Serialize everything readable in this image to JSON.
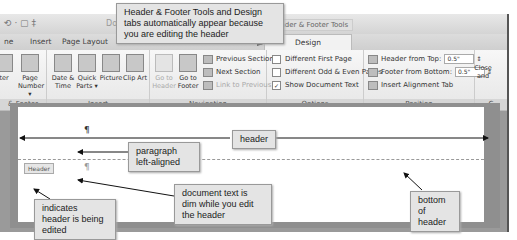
{
  "window": {
    "doc_title_fragment": "Do",
    "contextual_tab_label": "Header & Footer Tools",
    "quick_access": "⟲ · ▢ ‡"
  },
  "tabs": [
    {
      "label": "ne",
      "active": false
    },
    {
      "label": "Insert",
      "active": false
    },
    {
      "label": "Page Layout",
      "active": false
    },
    {
      "label": "R",
      "active": false
    },
    {
      "label": "View",
      "active": false
    },
    {
      "label": "Design",
      "active": true
    }
  ],
  "ribbon": {
    "header_footer_group": {
      "label": "& Footer",
      "buttons": [
        {
          "label": "ter"
        },
        {
          "label": "Page Number ▾"
        }
      ]
    },
    "insert_group": {
      "label": "Insert",
      "buttons": [
        {
          "label": "Date & Time"
        },
        {
          "label": "Quick Parts ▾"
        },
        {
          "label": "Picture"
        },
        {
          "label": "Clip Art"
        }
      ]
    },
    "navigation_group": {
      "label": "Navigation",
      "buttons": [
        {
          "label": "Go to Header",
          "enabled": false
        },
        {
          "label": "Go to Footer",
          "enabled": true
        }
      ],
      "small": [
        {
          "label": "Previous Section",
          "enabled": true
        },
        {
          "label": "Next Section",
          "enabled": true
        },
        {
          "label": "Link to Previous",
          "enabled": false
        }
      ]
    },
    "options_group": {
      "label": "Options",
      "checkboxes": [
        {
          "label": "Different First Page",
          "checked": false
        },
        {
          "label": "Different Odd & Even Pages",
          "checked": false
        },
        {
          "label": "Show Document Text",
          "checked": true
        }
      ]
    },
    "position_group": {
      "label": "Position",
      "header_from_top_label": "Header from Top:",
      "header_from_top_value": "0.5\"",
      "footer_from_bottom_label": "Footer from Bottom:",
      "footer_from_bottom_value": "0.5\"",
      "insert_alignment_tab": "Insert Alignment Tab"
    },
    "close_group": {
      "label": "C",
      "button": "Close and"
    }
  },
  "document": {
    "header_tag": "Header",
    "pilcrow": "¶"
  },
  "callouts": {
    "design_tabs": "Header & Footer Tools and Design tabs automatically appear because you are editing the header",
    "header": "header",
    "paragraph": "paragraph left-aligned",
    "document_text": "document text is dim while you edit the header",
    "header_edited": "indicates header is being edited",
    "bottom_header": "bottom of header"
  }
}
